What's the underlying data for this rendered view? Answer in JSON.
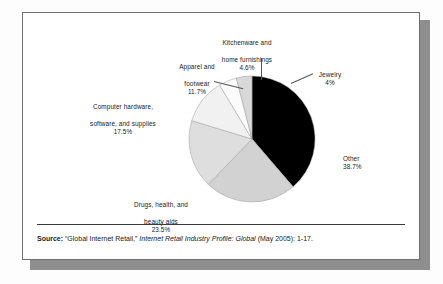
{
  "figure": {
    "source_prefix": "Source:",
    "source_quoted_title": "“Global Internet Retail,”",
    "source_publication": "Internet Retail Industry Profile: Global",
    "source_citation": "(May 2005): 1-17."
  },
  "chart_data": {
    "type": "pie",
    "title": "",
    "subtitle": "",
    "legend_position": "outside-labels",
    "grid": false,
    "start_angle_deg": 0,
    "direction": "clockwise",
    "categories": [
      "Other",
      "Drugs, health, and beauty aids",
      "Computer hardware, software, and supplies",
      "Apparel and footwear",
      "Kitchenware and home furnishings",
      "Jewelry"
    ],
    "values": [
      38.7,
      23.5,
      17.5,
      11.7,
      4.6,
      4.0
    ],
    "value_labels": [
      "38.7%",
      "23.5%",
      "17.5%",
      "11.7%",
      "4.6%",
      "4%"
    ],
    "colors": [
      "#000000",
      "#d2d2d2",
      "#dedede",
      "#f1f1f1",
      "#fbfbfb",
      "#d8d8d8"
    ],
    "slices": [
      {
        "name": "other",
        "label_line1": "Other",
        "label_pct": "38.7%",
        "value": 38.7,
        "color": "#000000"
      },
      {
        "name": "drugs",
        "label_line1": "Drugs, health, and",
        "label_line2": "beauty aids",
        "label_pct": "23.5%",
        "value": 23.5,
        "color": "#d2d2d2"
      },
      {
        "name": "computer",
        "label_line1": "Computer hardware,",
        "label_line2": "software, and supplies",
        "label_pct": "17.5%",
        "value": 17.5,
        "color": "#dedede"
      },
      {
        "name": "apparel",
        "label_line1": "Apparel and",
        "label_line2": "footwear",
        "label_pct": "11.7%",
        "value": 11.7,
        "color": "#f1f1f1"
      },
      {
        "name": "kitchenware",
        "label_line1": "Kitchenware and",
        "label_line2": "home furnishings",
        "label_pct": "4.6%",
        "value": 4.6,
        "color": "#fbfbfb"
      },
      {
        "name": "jewelry",
        "label_line1": "Jewelry",
        "label_pct": "4%",
        "value": 4.0,
        "color": "#d8d8d8"
      }
    ]
  }
}
